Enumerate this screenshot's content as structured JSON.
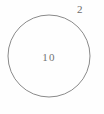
{
  "diagram": {
    "type": "circle-with-labels",
    "background_color": "#fefefe",
    "stroke_color": "#8a8a8a",
    "text_color": "#6e6e6e",
    "shape": {
      "name": "circle",
      "center_x": 49,
      "center_y": 56,
      "radius": 41,
      "stroke_width": 1
    },
    "center_label": "10",
    "radius_label": "2"
  }
}
